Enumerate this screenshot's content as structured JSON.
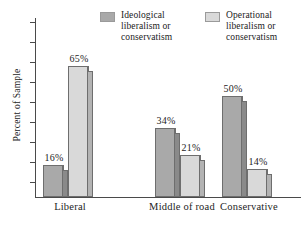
{
  "chart_data": {
    "type": "bar",
    "title": "",
    "xlabel": "",
    "ylabel": "Percent of Sample",
    "categories": [
      "Liberal",
      "Middle of road",
      "Conservative"
    ],
    "ylim": [
      0,
      70
    ],
    "grid": false,
    "legend_position": "top",
    "series": [
      {
        "name": "Ideological liberalism or conservatism",
        "color": "#a9a9a9",
        "side_color": "#8a8a8a",
        "values": [
          16,
          34,
          50
        ],
        "labels": [
          "16%",
          "34%",
          "50%"
        ]
      },
      {
        "name": "Operational liberalism or conservatism",
        "color": "#d9d9d9",
        "side_color": "#b3b3b3",
        "values": [
          65,
          21,
          14
        ],
        "labels": [
          "65%",
          "21%",
          "14%"
        ]
      }
    ]
  },
  "legend": {
    "entries": [
      {
        "label": "Ideological\nliberalism or\nconservatism",
        "swatch": "#a9a9a9"
      },
      {
        "label": "Operational\nliberalism or\nconservatism",
        "swatch": "#d9d9d9"
      }
    ]
  },
  "axis": {
    "y_title": "Percent of Sample",
    "tick_count": 9
  },
  "categories": {
    "items": [
      {
        "label": "Liberal"
      },
      {
        "label": "Middle of road"
      },
      {
        "label": "Conservative"
      }
    ]
  }
}
